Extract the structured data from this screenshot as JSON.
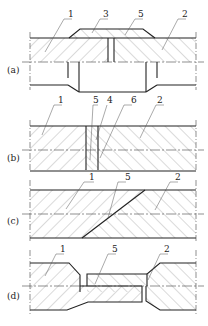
{
  "figure": {
    "panels": [
      {
        "id": "a",
        "label": "(a)",
        "callouts": [
          "1",
          "3",
          "5",
          "2"
        ]
      },
      {
        "id": "b",
        "label": "(b)",
        "callouts": [
          "1",
          "5",
          "4",
          "6",
          "2"
        ]
      },
      {
        "id": "c",
        "label": "(c)",
        "callouts": [
          "1",
          "5",
          "2"
        ]
      },
      {
        "id": "d",
        "label": "(d)",
        "callouts": [
          "1",
          "5",
          "2"
        ]
      }
    ]
  },
  "colors": {
    "line": "#222222",
    "hatch": "#777777",
    "background": "#ffffff"
  }
}
